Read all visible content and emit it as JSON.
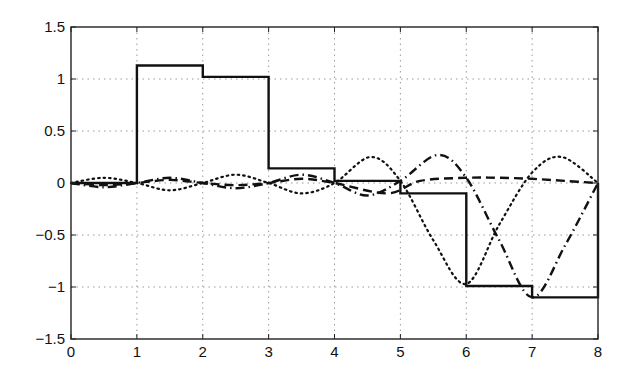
{
  "chart_data": {
    "type": "line",
    "title": "",
    "xlabel": "",
    "ylabel": "",
    "xlim": [
      0,
      8
    ],
    "ylim": [
      -1.5,
      1.5
    ],
    "grid": true,
    "legend": null,
    "x_ticks": [
      0,
      1,
      2,
      3,
      4,
      5,
      6,
      7,
      8
    ],
    "x_tick_labels": [
      "0",
      "1",
      "2",
      "3",
      "4",
      "5",
      "6",
      "7",
      "8"
    ],
    "y_ticks": [
      1.5,
      1,
      0.5,
      0,
      -0.5,
      -1,
      -1.5
    ],
    "y_tick_labels": [
      "1.5",
      "1",
      "0.5",
      "0",
      "−0.5",
      "−1",
      "−1.5"
    ],
    "series": [
      {
        "name": "step (solid)",
        "style": "solid",
        "width": 2.4,
        "x": [
          0,
          1,
          1,
          2,
          2,
          3,
          3,
          4,
          4,
          5,
          5,
          6,
          6,
          7,
          7,
          8,
          8
        ],
        "y": [
          0,
          0,
          1.13,
          1.13,
          1.02,
          1.02,
          0.14,
          0.14,
          0.02,
          0.02,
          -0.1,
          -0.1,
          -0.99,
          -0.99,
          -1.1,
          -1.1,
          0
        ]
      },
      {
        "name": "dotted",
        "style": "dotted",
        "width": 2.2,
        "x": [
          0,
          0.5,
          1,
          1.5,
          2,
          2.5,
          3,
          3.5,
          4,
          4.55,
          5,
          5.5,
          6,
          6.5,
          7,
          7.45,
          8
        ],
        "y": [
          0,
          0.05,
          0,
          -0.07,
          0,
          0.08,
          0,
          -0.1,
          0,
          0.25,
          0.02,
          -0.55,
          -0.97,
          -0.4,
          0.1,
          0.25,
          0
        ]
      },
      {
        "name": "dash-dot",
        "style": "dashdot",
        "width": 2.4,
        "x": [
          0,
          0.5,
          1,
          1.5,
          2,
          2.5,
          3,
          3.5,
          4,
          4.5,
          5,
          5.57,
          6,
          6.5,
          7,
          7.5,
          8
        ],
        "y": [
          0,
          -0.04,
          0,
          0.05,
          0,
          -0.05,
          0,
          0.08,
          0,
          -0.12,
          0.02,
          0.27,
          0.05,
          -0.55,
          -1.1,
          -0.6,
          0
        ]
      },
      {
        "name": "dashed",
        "style": "dashed",
        "width": 2.4,
        "x": [
          0,
          0.5,
          1,
          1.5,
          2,
          2.5,
          3,
          3.5,
          4,
          4.8,
          5.3,
          6,
          6.5,
          7,
          7.5,
          8
        ],
        "y": [
          0,
          -0.02,
          0,
          0.03,
          0,
          -0.02,
          0,
          0.04,
          0,
          -0.1,
          0.02,
          0.05,
          0.05,
          0.04,
          0.02,
          0
        ]
      }
    ]
  },
  "colors": {
    "line": "#111111",
    "axis": "#222222",
    "grid": "#9a9a9a",
    "background": "#ffffff"
  }
}
